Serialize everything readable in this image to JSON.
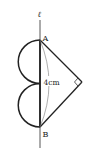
{
  "figure": {
    "line_label": "ℓ",
    "point_a": "A",
    "point_b": "B",
    "length_label": "4cm",
    "right_angle_marker": "right-angle",
    "colors": {
      "stroke": "#222222",
      "thin_stroke": "#555555",
      "background": "#ffffff"
    }
  }
}
